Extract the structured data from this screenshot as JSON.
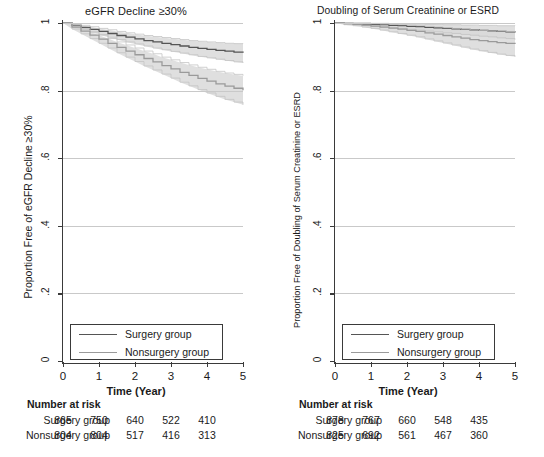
{
  "figure": {
    "width": 544,
    "height": 457,
    "colors": {
      "surgery_line": "#555555",
      "nonsurgery_line": "#9a9a9a",
      "ci_band": "#d9d9d9",
      "axis": "#3a3a3a",
      "grid": "#c9c9c9"
    }
  },
  "panels": [
    {
      "id": "egfr-decline",
      "title": "eGFR Decline ≥30%",
      "ylabel": "Proportion Free of eGFR Decline ≥30%",
      "xlabel": "Time (Year)",
      "legend": [
        {
          "label": "Surgery group",
          "color": "#555555"
        },
        {
          "label": "Nonsurgery group",
          "color": "#9a9a9a"
        }
      ],
      "risk": {
        "title": "Number at risk",
        "rows": [
          {
            "label": "Surgery group",
            "values": [
              "865",
              "750",
              "640",
              "522",
              "410"
            ]
          },
          {
            "label": "Nonsurgery group",
            "values": [
              "804",
              "804",
              "517",
              "416",
              "313"
            ]
          }
        ]
      }
    },
    {
      "id": "doubling-creatinine-esrd",
      "title": "Doubling of Serum Creatinine or ESRD",
      "ylabel": "Proportion Free of Doubling of Serum Creatinine or ESRD",
      "xlabel": "Time (Year)",
      "legend": [
        {
          "label": "Surgery group",
          "color": "#555555"
        },
        {
          "label": "Nonsurgery group",
          "color": "#9a9a9a"
        }
      ],
      "risk": {
        "title": "Number at risk",
        "rows": [
          {
            "label": "Surgery group",
            "values": [
              "878",
              "767",
              "660",
              "548",
              "435"
            ]
          },
          {
            "label": "Nonsurgery group",
            "values": [
              "825",
              "692",
              "561",
              "467",
              "360"
            ]
          }
        ]
      }
    }
  ],
  "chart_data": [
    {
      "type": "line",
      "id": "egfr-decline",
      "title": "eGFR Decline ≥30%",
      "xlabel": "Time (Year)",
      "ylabel": "Proportion Free of eGFR Decline ≥30%",
      "xlim": [
        0,
        5
      ],
      "ylim": [
        0,
        1
      ],
      "xticks": [
        0,
        1,
        2,
        3,
        4,
        5
      ],
      "yticks": [
        0,
        0.2,
        0.4,
        0.6,
        0.8,
        1
      ],
      "ytick_labels": [
        "0",
        ".2",
        ".4",
        ".6",
        ".8",
        "1"
      ],
      "grid": "horizontal",
      "legend_position": "bottom-left",
      "x": [
        0,
        0.25,
        0.5,
        0.75,
        1,
        1.25,
        1.5,
        1.75,
        2,
        2.25,
        2.5,
        2.75,
        3,
        3.25,
        3.5,
        3.75,
        4,
        4.25,
        4.5,
        4.75,
        5
      ],
      "series": [
        {
          "name": "Surgery group",
          "color": "#555555",
          "values": [
            1.0,
            0.993,
            0.987,
            0.981,
            0.975,
            0.969,
            0.963,
            0.958,
            0.953,
            0.948,
            0.944,
            0.94,
            0.936,
            0.932,
            0.928,
            0.925,
            0.922,
            0.919,
            0.917,
            0.914,
            0.912
          ],
          "ci_lower": [
            1.0,
            0.989,
            0.981,
            0.973,
            0.966,
            0.958,
            0.951,
            0.944,
            0.938,
            0.932,
            0.926,
            0.921,
            0.916,
            0.911,
            0.906,
            0.901,
            0.897,
            0.893,
            0.889,
            0.885,
            0.882
          ],
          "ci_upper": [
            1.0,
            0.997,
            0.993,
            0.989,
            0.984,
            0.98,
            0.975,
            0.971,
            0.967,
            0.963,
            0.96,
            0.957,
            0.954,
            0.951,
            0.948,
            0.946,
            0.944,
            0.942,
            0.94,
            0.939,
            0.938
          ]
        },
        {
          "name": "Nonsurgery group",
          "color": "#9a9a9a",
          "values": [
            1.0,
            0.988,
            0.976,
            0.964,
            0.952,
            0.94,
            0.928,
            0.917,
            0.906,
            0.895,
            0.885,
            0.874,
            0.864,
            0.854,
            0.845,
            0.836,
            0.828,
            0.82,
            0.813,
            0.807,
            0.801
          ],
          "ci_lower": [
            1.0,
            0.982,
            0.968,
            0.954,
            0.94,
            0.926,
            0.912,
            0.899,
            0.886,
            0.873,
            0.861,
            0.849,
            0.837,
            0.825,
            0.814,
            0.803,
            0.793,
            0.783,
            0.774,
            0.766,
            0.758
          ],
          "ci_upper": [
            1.0,
            0.994,
            0.984,
            0.974,
            0.964,
            0.954,
            0.944,
            0.935,
            0.926,
            0.917,
            0.909,
            0.899,
            0.891,
            0.883,
            0.876,
            0.869,
            0.863,
            0.857,
            0.852,
            0.848,
            0.844
          ]
        }
      ]
    },
    {
      "type": "line",
      "id": "doubling-creatinine-esrd",
      "title": "Doubling of Serum Creatinine or ESRD",
      "xlabel": "Time (Year)",
      "ylabel": "Proportion Free of Doubling of Serum Creatinine or ESRD",
      "xlim": [
        0,
        5
      ],
      "ylim": [
        0,
        1
      ],
      "xticks": [
        0,
        1,
        2,
        3,
        4,
        5
      ],
      "yticks": [
        0,
        0.2,
        0.4,
        0.6,
        0.8,
        1
      ],
      "ytick_labels": [
        "0",
        ".2",
        ".4",
        ".6",
        ".8",
        "1"
      ],
      "grid": "horizontal",
      "legend_position": "bottom-left",
      "x": [
        0,
        0.25,
        0.5,
        0.75,
        1,
        1.25,
        1.5,
        1.75,
        2,
        2.25,
        2.5,
        2.75,
        3,
        3.25,
        3.5,
        3.75,
        4,
        4.25,
        4.5,
        4.75,
        5
      ],
      "series": [
        {
          "name": "Surgery group",
          "color": "#555555",
          "values": [
            1.0,
            0.999,
            0.998,
            0.997,
            0.996,
            0.995,
            0.993,
            0.992,
            0.99,
            0.989,
            0.987,
            0.986,
            0.984,
            0.983,
            0.981,
            0.98,
            0.978,
            0.977,
            0.975,
            0.974,
            0.972
          ],
          "ci_lower": [
            1.0,
            0.997,
            0.995,
            0.993,
            0.991,
            0.989,
            0.986,
            0.984,
            0.981,
            0.979,
            0.976,
            0.974,
            0.971,
            0.969,
            0.966,
            0.964,
            0.961,
            0.959,
            0.956,
            0.954,
            0.951
          ],
          "ci_upper": [
            1.0,
            1.0,
            1.0,
            1.0,
            0.999,
            0.999,
            0.998,
            0.998,
            0.997,
            0.997,
            0.996,
            0.996,
            0.995,
            0.995,
            0.994,
            0.994,
            0.993,
            0.993,
            0.992,
            0.992,
            0.991
          ]
        },
        {
          "name": "Nonsurgery group",
          "color": "#9a9a9a",
          "values": [
            1.0,
            0.998,
            0.996,
            0.994,
            0.991,
            0.988,
            0.985,
            0.982,
            0.978,
            0.975,
            0.971,
            0.967,
            0.963,
            0.959,
            0.955,
            0.951,
            0.948,
            0.945,
            0.942,
            0.94,
            0.938
          ],
          "ci_lower": [
            1.0,
            0.995,
            0.992,
            0.988,
            0.984,
            0.979,
            0.974,
            0.969,
            0.964,
            0.959,
            0.953,
            0.947,
            0.941,
            0.935,
            0.929,
            0.923,
            0.918,
            0.913,
            0.908,
            0.904,
            0.9
          ],
          "ci_upper": [
            1.0,
            1.0,
            1.0,
            1.0,
            0.998,
            0.997,
            0.996,
            0.995,
            0.993,
            0.992,
            0.99,
            0.988,
            0.986,
            0.984,
            0.982,
            0.98,
            0.978,
            0.977,
            0.976,
            0.975,
            0.974
          ]
        }
      ]
    }
  ]
}
